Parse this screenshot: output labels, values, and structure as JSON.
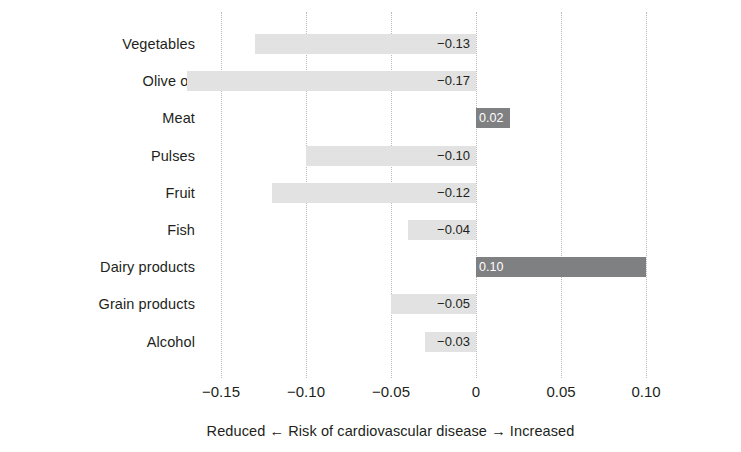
{
  "chart_data": {
    "type": "bar",
    "orientation": "horizontal",
    "title": "",
    "subtitle": "",
    "xlabel": "Reduced ← Risk of cardiovascular disease → Increased",
    "ylabel": "",
    "xlim": [
      -0.175,
      0.115
    ],
    "xticks": [
      -0.15,
      -0.1,
      -0.05,
      0,
      0.05,
      0.1
    ],
    "xtick_labels": [
      "−0.15",
      "−0.10",
      "−0.05",
      "0",
      "0.05",
      "0.10"
    ],
    "grid": "vertical dotted gridlines at each x tick",
    "legend": "none",
    "zero_reference": 0,
    "categories": [
      "Vegetables",
      "Olive oil",
      "Meat",
      "Pulses",
      "Fruit",
      "Fish",
      "Dairy products",
      "Grain products",
      "Alcohol"
    ],
    "values": [
      -0.13,
      -0.17,
      0.02,
      -0.1,
      -0.12,
      -0.04,
      0.1,
      -0.05,
      -0.03
    ],
    "value_labels": [
      "−0.13",
      "−0.17",
      "0.02",
      "−0.10",
      "−0.12",
      "−0.04",
      "0.10",
      "−0.05",
      "−0.03"
    ],
    "bars": [
      {
        "category": "Vegetables",
        "value": -0.13,
        "label": "−0.13",
        "sign": "neg"
      },
      {
        "category": "Olive oil",
        "value": -0.17,
        "label": "−0.17",
        "sign": "neg"
      },
      {
        "category": "Meat",
        "value": 0.02,
        "label": "0.02",
        "sign": "pos"
      },
      {
        "category": "Pulses",
        "value": -0.1,
        "label": "−0.10",
        "sign": "neg"
      },
      {
        "category": "Fruit",
        "value": -0.12,
        "label": "−0.12",
        "sign": "neg"
      },
      {
        "category": "Fish",
        "value": -0.04,
        "label": "−0.04",
        "sign": "neg"
      },
      {
        "category": "Dairy products",
        "value": 0.1,
        "label": "0.10",
        "sign": "pos"
      },
      {
        "category": "Grain products",
        "value": -0.05,
        "label": "−0.05",
        "sign": "neg"
      },
      {
        "category": "Alcohol",
        "value": -0.03,
        "label": "−0.03",
        "sign": "neg"
      }
    ],
    "colors": {
      "negative_bar": "#e2e2e2",
      "positive_bar": "#7f8082",
      "gridline": "#b9b9b9",
      "text": "#231f20",
      "positive_bar_label": "#ffffff",
      "background": "#ffffff"
    }
  }
}
